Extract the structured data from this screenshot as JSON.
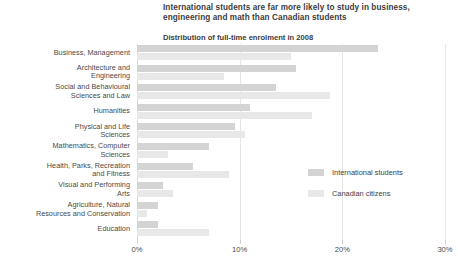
{
  "header": {
    "title": "International students are far more likely to study in business, engineering and math than Canadian students",
    "subtitle": "Distribution of full-time enrolment in 2008"
  },
  "legend": {
    "items": [
      {
        "label": "International students",
        "color": "#d4d4d4",
        "name": "international-students"
      },
      {
        "label": "Canadian citizens",
        "color": "#e8e8e8",
        "name": "canadian-citizens"
      }
    ]
  },
  "axis": {
    "ticks": [
      "0%",
      "10%",
      "20%",
      "30%"
    ],
    "tick_values": [
      0,
      10,
      20,
      30
    ]
  },
  "chart_data": {
    "type": "bar",
    "orientation": "horizontal",
    "title": "International students are far more likely to study in business, engineering and math than Canadian students",
    "subtitle": "Distribution of full-time enrolment in 2008",
    "xlabel": "",
    "ylabel": "",
    "xlim": [
      0,
      30
    ],
    "xticks": [
      0,
      10,
      20,
      30
    ],
    "xticklabels": [
      "0%",
      "10%",
      "20%",
      "30%"
    ],
    "grid": true,
    "legend_position": "middle-right",
    "categories": [
      "Business, Management",
      "Architecture and Engineering",
      "Social and Behavioural Sciences and Law",
      "Humanities",
      "Physical and Life Sciences",
      "Mathematics, Computer Sciences",
      "Health, Parks, Recreation and Fitness",
      "Visual and Performing Arts",
      "Agriculture, Natural Resources and Conservation",
      "Education"
    ],
    "series": [
      {
        "name": "International students",
        "color": "#d4d4d4",
        "values": [
          23.5,
          15.5,
          13.5,
          11.0,
          9.5,
          7.0,
          5.5,
          2.5,
          2.0,
          2.0
        ]
      },
      {
        "name": "Canadian citizens",
        "color": "#e8e8e8",
        "values": [
          15.0,
          8.5,
          18.8,
          17.0,
          10.5,
          3.0,
          9.0,
          3.5,
          1.0,
          7.0
        ]
      }
    ]
  },
  "category_labels": [
    {
      "lines": [
        "Business, Management"
      ]
    },
    {
      "lines": [
        "Architecture and",
        "Engineering"
      ]
    },
    {
      "lines": [
        "Social and Behavioural",
        "Sciences and Law"
      ]
    },
    {
      "lines": [
        "Humanities"
      ]
    },
    {
      "lines": [
        "Physical and Life",
        "Sciences"
      ]
    },
    {
      "lines": [
        "Mathematics, Computer",
        "Sciences"
      ]
    },
    {
      "lines": [
        "Health, Parks, Recreation",
        "and Fitness"
      ]
    },
    {
      "lines": [
        "Visual and Performing",
        "Arts"
      ]
    },
    {
      "lines": [
        "Agriculture, Natural",
        "Resources and Conservation"
      ]
    },
    {
      "lines": [
        "Education"
      ]
    }
  ]
}
